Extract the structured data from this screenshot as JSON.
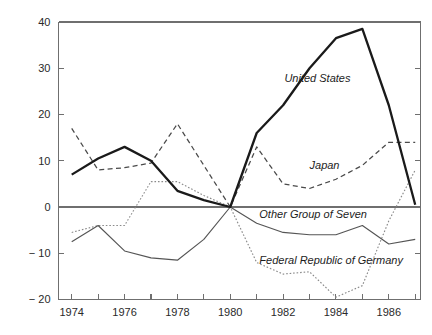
{
  "chart_data": {
    "type": "line",
    "title": "",
    "subtitle": "",
    "xlabel": "",
    "ylabel": "",
    "xlim": [
      1973.5,
      1987.2
    ],
    "ylim": [
      -20,
      40
    ],
    "grid": false,
    "legend_position": "inline-annotations",
    "x": [
      1974,
      1975,
      1976,
      1977,
      1978,
      1979,
      1980,
      1981,
      1982,
      1983,
      1984,
      1985,
      1986,
      1987
    ],
    "y_ticks": [
      -20,
      -10,
      0,
      10,
      20,
      30,
      40
    ],
    "y_ticklabels": [
      "− 20",
      "− 10",
      "0",
      "10",
      "20",
      "30",
      "40"
    ],
    "x_ticks": [
      1974,
      1975,
      1976,
      1977,
      1978,
      1979,
      1980,
      1981,
      1982,
      1983,
      1984,
      1985,
      1986,
      1987
    ],
    "x_ticklabels_shown": [
      "1974",
      "1976",
      "1978",
      "1980",
      "1982",
      "1984",
      "1986"
    ],
    "x_ticklabel_values": [
      1974,
      1976,
      1978,
      1980,
      1982,
      1984,
      1986
    ],
    "series": [
      {
        "name": "United States",
        "style": "solid-thick",
        "color": "#1a1a1a",
        "label_x": 1982.05,
        "label_y": 27.0,
        "values": [
          7.0,
          10.5,
          13.0,
          10.0,
          3.5,
          1.5,
          0.0,
          16.0,
          22.0,
          30.0,
          36.5,
          38.5,
          22.0,
          0.5
        ]
      },
      {
        "name": "Japan",
        "style": "dashed",
        "color": "#4a4a4a",
        "label_x": 1983.0,
        "label_y": 8.2,
        "values": [
          17.0,
          8.0,
          8.5,
          9.5,
          18.0,
          9.0,
          0.0,
          13.0,
          5.0,
          4.0,
          6.0,
          9.0,
          14.0,
          14.0
        ]
      },
      {
        "name": "Other Group of Seven",
        "style": "solid-thin",
        "color": "#555555",
        "label_x": 1981.1,
        "label_y": -2.4,
        "values": [
          -7.5,
          -4.0,
          -9.5,
          -11.0,
          -11.5,
          -7.0,
          0.0,
          -3.5,
          -5.5,
          -6.0,
          -6.0,
          -4.0,
          -8.0,
          -7.0
        ]
      },
      {
        "name": "Federal Republic of Germany",
        "style": "dotted",
        "color": "#8a8a8a",
        "label_x": 1981.1,
        "label_y": -12.3,
        "values": [
          -5.5,
          -4.0,
          -4.0,
          5.5,
          5.5,
          2.5,
          0.0,
          -12.0,
          -14.5,
          -14.0,
          -19.5,
          -17.0,
          -3.0,
          8.0
        ]
      }
    ]
  }
}
